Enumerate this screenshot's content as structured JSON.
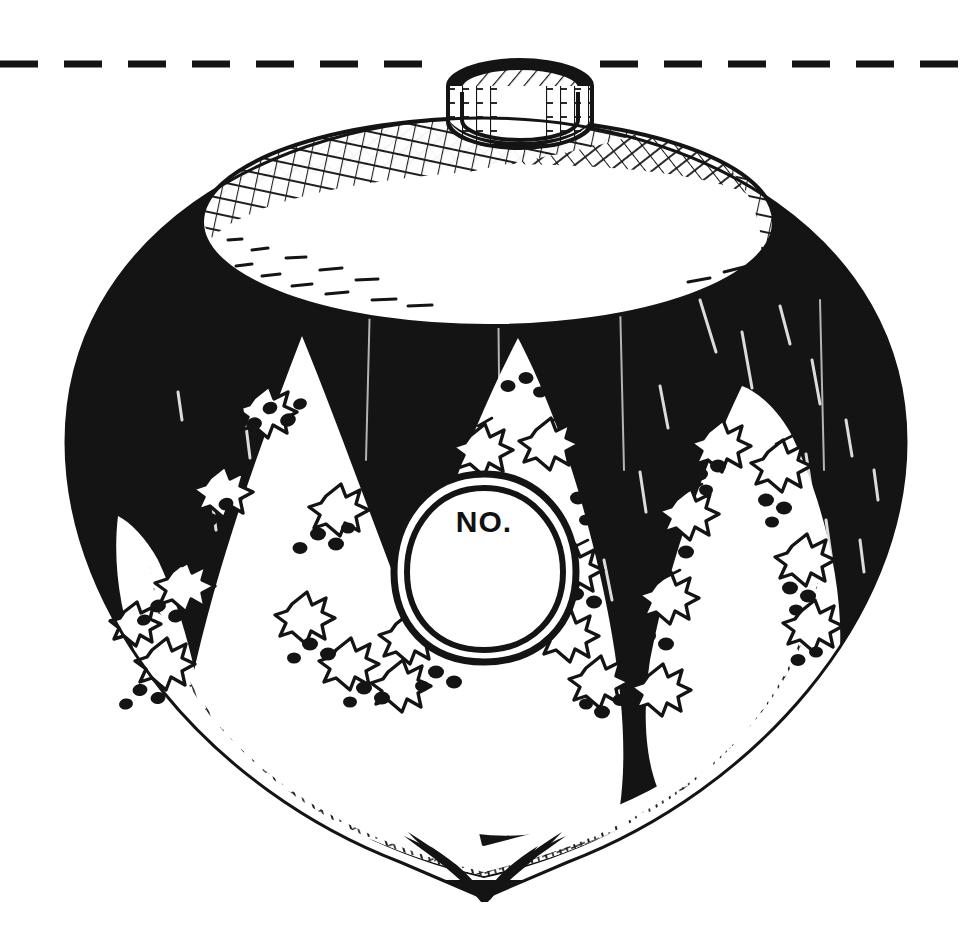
{
  "image": {
    "kind": "line-art-illustration",
    "subject": "christmas-tree-ornament-bauble",
    "width": 968,
    "height": 944,
    "background_color": "#ffffff",
    "ink_color": "#141414"
  },
  "cut_guide": {
    "name": "dashed-cut-line",
    "orientation": "horizontal",
    "y": 64,
    "dash_length": 38,
    "gap_length": 26,
    "stroke_width": 7,
    "color": "#141414"
  },
  "ornament": {
    "cap": {
      "name": "ornament-cap",
      "shape": "cylinder",
      "hatching": "cross-hatch",
      "outline_color": "#141414"
    },
    "shoulder": {
      "name": "ornament-shoulder",
      "shape": "ellipse",
      "fill": "#ffffff",
      "hatching": "cross-hatch"
    },
    "body": {
      "name": "ornament-body",
      "shape": "bulb",
      "fill": "#141414"
    },
    "tip": {
      "name": "ornament-bottom-tip",
      "shape": "point"
    },
    "petals": {
      "name": "white-flame-petals",
      "count": 4,
      "fill": "#ffffff",
      "decoration": "holly-leaves-and-berries"
    },
    "medallion": {
      "name": "number-medallion",
      "shape": "oval",
      "rings": 2,
      "label": "NO.",
      "label_color": "#141414"
    }
  },
  "decorations": {
    "holly_leaf": {
      "name": "holly-leaf-icon",
      "count": 14,
      "fill": "#ffffff",
      "stroke": "#141414"
    },
    "berry": {
      "name": "holly-berry-icon",
      "count": 46,
      "fill": "#141414"
    }
  }
}
